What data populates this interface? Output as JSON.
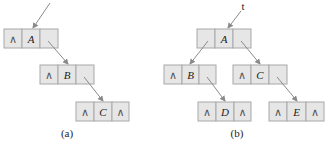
{
  "diagram": {
    "cell_colors": {
      "fill": "#e6e6e6",
      "border": "#a8a8a8",
      "arrow": "#8a8a8a"
    },
    "null_symbol": "∧",
    "panels": [
      {
        "caption": "(a)",
        "root_pointer_label": "",
        "nodes": [
          {
            "id": "A",
            "left": "∧",
            "data": "A",
            "right": ""
          },
          {
            "id": "B",
            "left": "∧",
            "data": "B",
            "right": ""
          },
          {
            "id": "C",
            "left": "∧",
            "data": "C",
            "right": "∧"
          }
        ],
        "edges": [
          {
            "from": "A.right",
            "to": "B"
          },
          {
            "from": "B.right",
            "to": "C"
          }
        ]
      },
      {
        "caption": "(b)",
        "root_pointer_label": "t",
        "nodes": [
          {
            "id": "A",
            "left": "",
            "data": "A",
            "right": ""
          },
          {
            "id": "B",
            "left": "∧",
            "data": "B",
            "right": ""
          },
          {
            "id": "C",
            "left": "∧",
            "data": "C",
            "right": ""
          },
          {
            "id": "D",
            "left": "∧",
            "data": "D",
            "right": "∧"
          },
          {
            "id": "E",
            "left": "∧",
            "data": "E",
            "right": "∧"
          }
        ],
        "edges": [
          {
            "from": "A.left",
            "to": "B"
          },
          {
            "from": "A.right",
            "to": "C"
          },
          {
            "from": "B.right",
            "to": "D"
          },
          {
            "from": "C.right",
            "to": "E"
          }
        ]
      }
    ]
  }
}
